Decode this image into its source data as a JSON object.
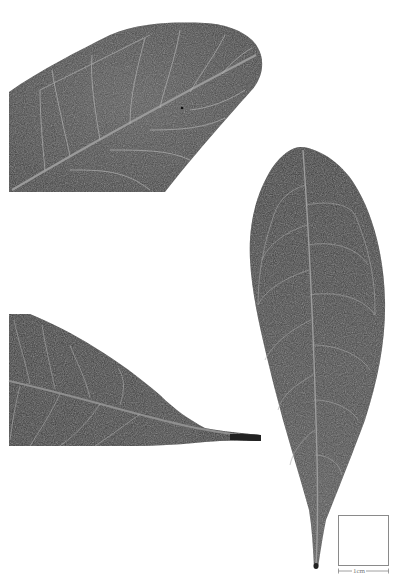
{
  "figure": {
    "panels": [
      {
        "id": "upper-left",
        "description": "leaf apex detail, cropped",
        "orientation": "diagonal, apex to upper right"
      },
      {
        "id": "lower-left",
        "description": "leaf base detail with petiole, cropped",
        "orientation": "petiole to right"
      },
      {
        "id": "right",
        "description": "whole leaf, obovate, petiole at bottom",
        "orientation": "vertical"
      }
    ],
    "colors": {
      "background": "#ffffff",
      "leaf_dark": "#3a3a3a",
      "leaf_mid": "#555555",
      "vein": "#b8b8b8",
      "midrib": "#9a9a9a",
      "scale": "#888888"
    }
  },
  "scale": {
    "label": "1cm"
  }
}
